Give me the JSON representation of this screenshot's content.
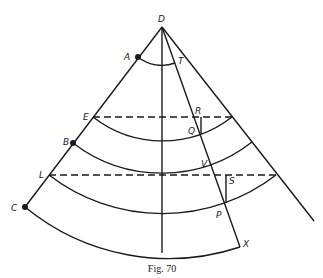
{
  "figure": {
    "caption": "Fig. 70",
    "labels": {
      "D": "D",
      "A": "A",
      "T": "T",
      "E": "E",
      "R": "R",
      "Q": "Q",
      "B": "B",
      "V": "V",
      "L": "L",
      "S": "S",
      "C": "C",
      "P": "P",
      "X": "X"
    },
    "points": {
      "D": [
        162,
        27
      ],
      "A": [
        138,
        57
      ],
      "E": [
        93,
        117
      ],
      "B": [
        73,
        143
      ],
      "L": [
        49,
        175
      ],
      "C": [
        25,
        207
      ],
      "X": [
        240,
        247
      ]
    },
    "arcs": [
      "A-T arc",
      "E arc",
      "B arc",
      "L arc",
      "C arc"
    ],
    "dashed_lines": [
      "E line",
      "L line"
    ],
    "colors": {
      "ink": "#1a1a1a",
      "background": "#ffffff"
    }
  }
}
